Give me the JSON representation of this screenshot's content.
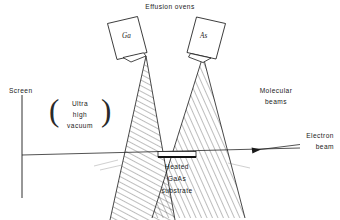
{
  "figure": {
    "title": "Effusion ovens",
    "background_color": "#ffffff",
    "ink_color": "#1a1a1a"
  },
  "ovens": [
    {
      "name": "ga-oven",
      "label": "Ga",
      "side": "left"
    },
    {
      "name": "as-oven",
      "label": "As",
      "side": "right"
    }
  ],
  "labels": {
    "screen": "Screen",
    "vacuum_line1": "Ultra",
    "vacuum_line2": "high",
    "vacuum_line3": "vacuum",
    "paren_open": "(",
    "paren_close": ")",
    "molecular_line1": "Molecular",
    "molecular_line2": "beams",
    "electron_line1": "Electron",
    "electron_line2": "beam",
    "substrate_line1": "Heated",
    "substrate_line2": "GaAs",
    "substrate_line3": "substrate"
  }
}
